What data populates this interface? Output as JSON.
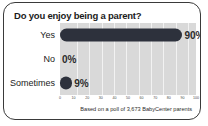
{
  "chart_data": {
    "type": "bar",
    "orientation": "horizontal",
    "title": "Do you enjoy being a parent?",
    "categories": [
      "Yes",
      "No",
      "Sometimes"
    ],
    "values": [
      90,
      0,
      9
    ],
    "value_labels": [
      "90%",
      "0%",
      "9%"
    ],
    "xlabel": "",
    "ylabel": "",
    "xlim": [
      0,
      100
    ],
    "xticks": [
      0,
      10,
      20,
      30,
      40,
      50,
      60,
      70,
      80,
      90,
      100
    ],
    "xtick_labels": [
      "0",
      "10",
      "20",
      "30",
      "40",
      "50",
      "60",
      "70",
      "80",
      "90",
      "100"
    ],
    "grid": true,
    "legend": false,
    "footnote": "Based on a poll of 3,673 BabyCenter parents",
    "colors": {
      "bar": "#2d313c",
      "plot_background": "#d9d9d9",
      "gridline": "#f2f2f2",
      "card_background": "#ffffff",
      "card_border": "#3a3a3a",
      "text": "#1b1b1b"
    }
  }
}
